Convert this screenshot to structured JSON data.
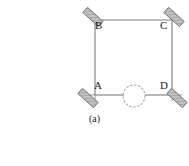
{
  "figure": {
    "caption": "(a)",
    "line_color": "#7d7d7d",
    "mirror_fill": "#b3b3b3",
    "mirror_stroke": "#6e6e6e",
    "text_color": "#1a1a1a",
    "background": "#ffffff"
  },
  "labels": {
    "A": "A",
    "B": "B",
    "C": "C",
    "D": "D"
  },
  "geometry": {
    "square": {
      "left": 95,
      "top": 20,
      "right": 172,
      "bottom": 95
    },
    "beam_stub_left_x": 78,
    "beam_stub_right_x": 186,
    "dotted_circle": {
      "cx": 134,
      "cy": 96,
      "r": 11
    },
    "mirrors": [
      {
        "name": "mirror-B",
        "corner": "B",
        "cx": 93,
        "cy": 17,
        "angle": 42,
        "w": 21,
        "h": 7
      },
      {
        "name": "mirror-C",
        "corner": "C",
        "cx": 174,
        "cy": 17,
        "angle": 42,
        "w": 21,
        "h": 7
      },
      {
        "name": "mirror-A",
        "corner": "A",
        "cx": 88,
        "cy": 98,
        "angle": 42,
        "w": 21,
        "h": 7
      },
      {
        "name": "mirror-D",
        "corner": "D",
        "cx": 176,
        "cy": 98,
        "angle": 42,
        "w": 21,
        "h": 7
      }
    ]
  }
}
